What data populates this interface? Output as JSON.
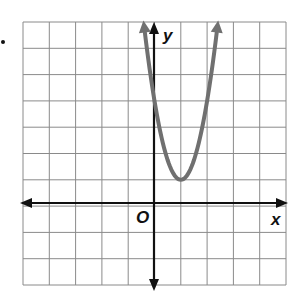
{
  "problem": {
    "bullet": "•"
  },
  "chart_data": {
    "type": "line",
    "title": "",
    "xlabel": "x",
    "ylabel": "y",
    "origin_label": "O",
    "grid": true,
    "xlim": [
      -5,
      5
    ],
    "ylim": [
      -3,
      7
    ],
    "tick_labels_shown": false,
    "series": [
      {
        "name": "parabola",
        "equation": "y = 3(x - 1)^2 + 1",
        "vertex": [
          1,
          1
        ],
        "y_intercept": 4,
        "color": "#707070",
        "arrows_at_ends": true,
        "x": [
          -0.73,
          -0.5,
          0,
          0.5,
          1,
          1.5,
          2,
          2.5,
          2.73
        ],
        "y": [
          10,
          7.75,
          4,
          1.75,
          1,
          1.75,
          4,
          7.75,
          10
        ]
      }
    ]
  },
  "colors": {
    "grid": "#8a8a8a",
    "axis": "#111111",
    "curve": "#707070"
  }
}
